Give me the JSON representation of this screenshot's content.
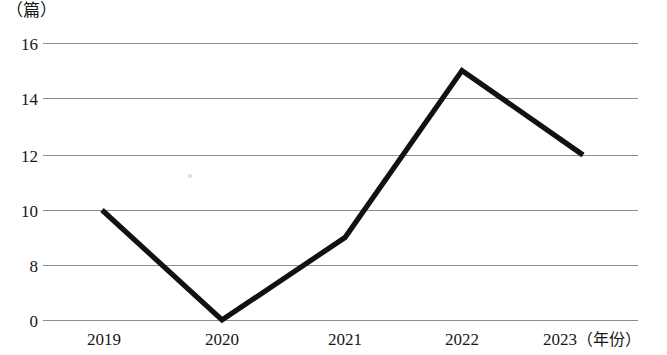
{
  "chart_data": {
    "type": "line",
    "title": "",
    "subtitle": "",
    "xlabel": "年份",
    "ylabel": "篇",
    "y_unit_caption": "（篇）",
    "x_axis_caption": "（年份）",
    "categories": [
      "2019",
      "2020",
      "2021",
      "2022",
      "2023"
    ],
    "values": [
      10,
      0,
      9,
      15,
      12
    ],
    "series": [
      {
        "name": "发文量",
        "values": [
          10,
          0,
          9,
          15,
          12
        ]
      }
    ],
    "ytick_labels": [
      "16",
      "14",
      "12",
      "10",
      "8",
      "0"
    ],
    "ytick_values": [
      16,
      14,
      12,
      10,
      8,
      0
    ],
    "ylim": [
      0,
      16
    ],
    "axis_broken": true,
    "grid": true,
    "grid_axis": "y",
    "legend": "none",
    "markers": "none",
    "line_color": "#111111",
    "grid_color": "#8c8c8c",
    "background_color": "#ffffff",
    "annotations": []
  },
  "geometry": {
    "plot_left": 43,
    "plot_right": 638,
    "gridline_y": [
      43,
      98,
      155,
      210,
      265,
      320
    ],
    "point_x": [
      102,
      222,
      345,
      462,
      583
    ],
    "point_y": [
      210,
      320,
      238,
      77,
      155
    ],
    "polyline_points": "102,210 222,320 345,238 462,77 583,155"
  }
}
